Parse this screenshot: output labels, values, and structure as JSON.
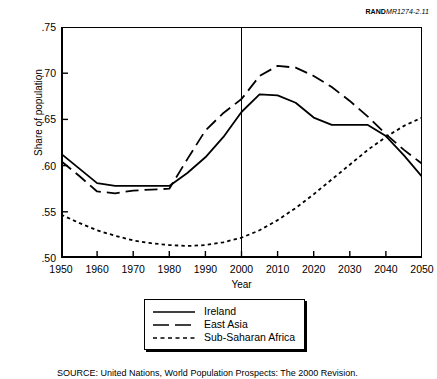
{
  "figure_id": {
    "org": "RAND",
    "number": "MR1274-2.11"
  },
  "source_note": "SOURCE: United Nations, World Population Prospects: The 2000 Revision.",
  "legend": {
    "items": [
      {
        "label": "Ireland",
        "style": "solid"
      },
      {
        "label": "East Asia",
        "style": "dashed"
      },
      {
        "label": "Sub-Saharan Africa",
        "style": "dotted"
      }
    ]
  },
  "chart_data": {
    "type": "line",
    "title": "",
    "xlabel": "Year",
    "ylabel": "Share of population",
    "xlim": [
      1950,
      2050
    ],
    "ylim": [
      0.5,
      0.75
    ],
    "xticks": [
      1950,
      1960,
      1970,
      1980,
      1990,
      2000,
      2010,
      2020,
      2030,
      2040,
      2050
    ],
    "xtick_labels": [
      "1950",
      "1960",
      "1970",
      "1980",
      "1990",
      "2000",
      "2010",
      "2020",
      "2030",
      "2040",
      "2050"
    ],
    "yticks": [
      0.5,
      0.55,
      0.6,
      0.65,
      0.7,
      0.75
    ],
    "ytick_labels": [
      ".50",
      ".55",
      ".60",
      ".65",
      ".70",
      ".75"
    ],
    "grid": false,
    "legend_position": "below-center",
    "annotations": [
      {
        "type": "vline",
        "x": 2000,
        "label": "projection divide"
      }
    ],
    "x": [
      1950,
      1955,
      1960,
      1965,
      1970,
      1975,
      1980,
      1985,
      1990,
      1995,
      2000,
      2005,
      2010,
      2015,
      2020,
      2025,
      2030,
      2035,
      2040,
      2045,
      2050
    ],
    "series": [
      {
        "name": "Ireland",
        "style": "solid",
        "color": "#000000",
        "values": [
          0.613,
          0.597,
          0.581,
          0.578,
          0.578,
          0.578,
          0.578,
          0.592,
          0.609,
          0.631,
          0.658,
          0.677,
          0.676,
          0.668,
          0.652,
          0.644,
          0.644,
          0.644,
          0.632,
          0.611,
          0.588
        ]
      },
      {
        "name": "East Asia",
        "style": "dashed",
        "color": "#000000",
        "values": [
          0.605,
          0.589,
          0.572,
          0.57,
          0.573,
          0.574,
          0.575,
          0.607,
          0.638,
          0.657,
          0.672,
          0.697,
          0.708,
          0.706,
          0.697,
          0.685,
          0.67,
          0.653,
          0.634,
          0.617,
          0.602
        ]
      },
      {
        "name": "Sub-Saharan Africa",
        "style": "dotted",
        "color": "#000000",
        "values": [
          0.547,
          0.538,
          0.53,
          0.524,
          0.519,
          0.516,
          0.514,
          0.513,
          0.514,
          0.517,
          0.522,
          0.53,
          0.541,
          0.554,
          0.569,
          0.585,
          0.601,
          0.617,
          0.631,
          0.643,
          0.652
        ]
      }
    ]
  }
}
